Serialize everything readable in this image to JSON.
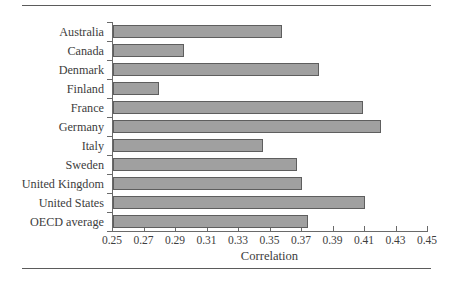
{
  "chart_data": {
    "type": "bar",
    "orientation": "horizontal",
    "title": "",
    "xlabel": "Correlation",
    "ylabel": "",
    "xlim": [
      0.25,
      0.45
    ],
    "xticks": [
      "0.25",
      "0.27",
      "0.29",
      "0.31",
      "0.33",
      "0.35",
      "0.37",
      "0.39",
      "0.41",
      "0.43",
      "0.45"
    ],
    "xtick_values": [
      0.25,
      0.27,
      0.29,
      0.31,
      0.33,
      0.35,
      0.37,
      0.39,
      0.41,
      0.43,
      0.45
    ],
    "grid": false,
    "legend": false,
    "bar_fill_color": "#a0a0a0",
    "bar_edge_color": "#5e5e5e",
    "categories": [
      "Australia",
      "Canada",
      "Denmark",
      "Finland",
      "France",
      "Germany",
      "Italy",
      "Sweden",
      "United Kingdom",
      "United States",
      "OECD average"
    ],
    "values": [
      0.357,
      0.295,
      0.381,
      0.279,
      0.409,
      0.42,
      0.345,
      0.367,
      0.37,
      0.41,
      0.374
    ]
  },
  "rules": {
    "top": "horizontal-rule",
    "bottom": "horizontal-rule"
  }
}
